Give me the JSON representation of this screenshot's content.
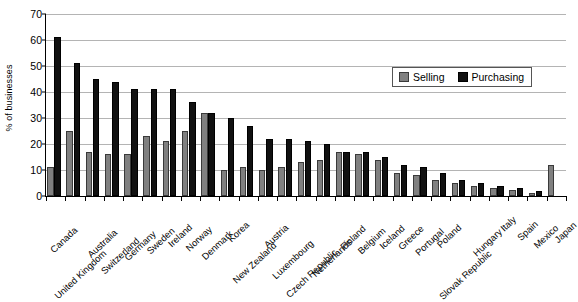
{
  "chart_data": {
    "type": "bar",
    "title": "",
    "xlabel": "",
    "ylabel": "% of businesses",
    "ylim": [
      0,
      70
    ],
    "ytick_step": 10,
    "yticks": [
      0,
      10,
      20,
      30,
      40,
      50,
      60,
      70
    ],
    "grid": true,
    "legend_position": "upper right",
    "categories": [
      "Canada",
      "United Kingdom",
      "Australia",
      "Switzerland",
      "Germany",
      "Sweden",
      "Ireland",
      "Norway",
      "Denmark",
      "Korea",
      "New Zealand",
      "Austria",
      "Luxembourg",
      "Czech Republic",
      "Netherlands",
      "Finland",
      "Belgium",
      "Iceland",
      "Greece",
      "Portugal",
      "Poland",
      "Slovak Republic",
      "Hungary",
      "Italy",
      "Spain",
      "Mexico",
      "Japan"
    ],
    "series": [
      {
        "name": "Selling",
        "color": "#808080",
        "values": [
          11,
          25,
          17,
          16,
          16,
          23,
          21,
          25,
          32,
          10,
          11,
          10,
          11,
          13,
          14,
          17,
          16,
          14,
          9,
          8,
          6,
          5,
          4,
          3,
          2.5,
          1,
          12
        ]
      },
      {
        "name": "Purchasing",
        "color": "#111111",
        "values": [
          61,
          51,
          45,
          44,
          41,
          41,
          41,
          36,
          32,
          30,
          27,
          22,
          22,
          21,
          20,
          17,
          17,
          15,
          12,
          11,
          9,
          6,
          5,
          4,
          3,
          2,
          null
        ]
      }
    ]
  },
  "legend": {
    "items": [
      {
        "label": "Selling"
      },
      {
        "label": "Purchasing"
      }
    ]
  }
}
